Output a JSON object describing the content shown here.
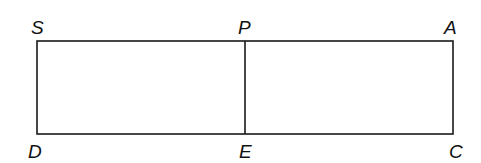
{
  "diagram": {
    "type": "rectangle-divided",
    "stroke_color": "#1a1a1a",
    "background": "#ffffff",
    "points": {
      "S": {
        "label": "S",
        "position": "top-left"
      },
      "P": {
        "label": "P",
        "position": "top-middle"
      },
      "A": {
        "label": "A",
        "position": "top-right"
      },
      "D": {
        "label": "D",
        "position": "bottom-left"
      },
      "E": {
        "label": "E",
        "position": "bottom-middle"
      },
      "C": {
        "label": "C",
        "position": "bottom-right"
      }
    },
    "segments": [
      "SA",
      "AC",
      "CD",
      "DS",
      "PE"
    ]
  }
}
